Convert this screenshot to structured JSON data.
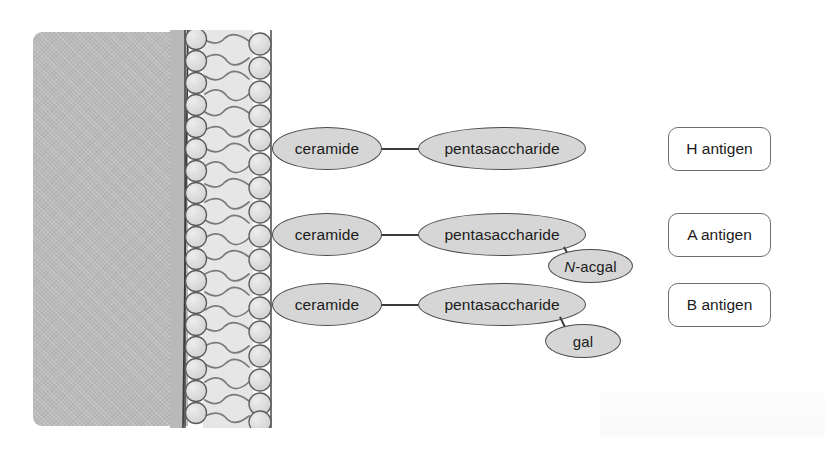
{
  "figure": {
    "background_color": "#ffffff",
    "cell_interior_color": "#b9b9b9",
    "ellipse_fill": "#d6d6d6",
    "ellipse_stroke": "#4a4a4a",
    "box_stroke": "#6e6e6e"
  },
  "membrane": {
    "label": "lipid-bilayer",
    "head_count_per_leaflet": 18,
    "head_fill": "#dedede",
    "head_stroke": "#5d5d5d",
    "tail_stroke": "#6b6b6b"
  },
  "rows": [
    {
      "id": "h-antigen-row",
      "ceramide": "ceramide",
      "core": "pentasaccharide",
      "terminal": null,
      "antigen": "H antigen"
    },
    {
      "id": "a-antigen-row",
      "ceramide": "ceramide",
      "core": "pentasaccharide",
      "terminal": "N-acgal",
      "terminal_italic_prefix": "N",
      "terminal_rest": "-acgal",
      "antigen": "A antigen"
    },
    {
      "id": "b-antigen-row",
      "ceramide": "ceramide",
      "core": "pentasaccharide",
      "terminal": "gal",
      "antigen": "B antigen"
    }
  ]
}
